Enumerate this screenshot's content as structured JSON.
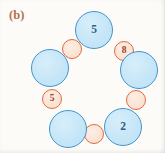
{
  "figure": {
    "panel_label": "(b)",
    "panel_label_color": "#b5714d",
    "background_color": "#fcfbf7",
    "width": 165,
    "height": 153
  },
  "palette": {
    "big_fill": "#c6e6f7",
    "big_stroke": "#3f95cf",
    "big_text": "#2f5d86",
    "small_fill": "#fbe3d4",
    "small_stroke": "#e06a42",
    "small_text": "#9e3c1d"
  },
  "chart_data": {
    "type": "diagram",
    "title": "(b)",
    "layout": "ring",
    "node_count": 10,
    "labeled_values": [
      5,
      8,
      2,
      5
    ],
    "nodes": [
      {
        "id": "big-top",
        "kind": "big",
        "label": "5",
        "cx": 94,
        "cy": 30,
        "r": 19,
        "angle_deg": 90
      },
      {
        "id": "small-upper-right",
        "kind": "small",
        "label": "8",
        "cx": 124,
        "cy": 51,
        "r": 10,
        "angle_deg": 54
      },
      {
        "id": "big-right",
        "kind": "big",
        "label": "",
        "cx": 139,
        "cy": 70,
        "r": 19,
        "angle_deg": 18
      },
      {
        "id": "small-lower-right",
        "kind": "small",
        "label": "",
        "cx": 136,
        "cy": 100,
        "r": 10,
        "angle_deg": -18
      },
      {
        "id": "big-bottom-right",
        "kind": "big",
        "label": "2",
        "cx": 123,
        "cy": 127,
        "r": 19,
        "angle_deg": -54
      },
      {
        "id": "small-bottom",
        "kind": "small",
        "label": "",
        "cx": 94,
        "cy": 134,
        "r": 10,
        "angle_deg": -90
      },
      {
        "id": "big-bottom-left",
        "kind": "big",
        "label": "",
        "cx": 68,
        "cy": 129,
        "r": 19,
        "angle_deg": -126
      },
      {
        "id": "small-lower-left",
        "kind": "small",
        "label": "5",
        "cx": 52,
        "cy": 99,
        "r": 10,
        "angle_deg": -162
      },
      {
        "id": "big-left",
        "kind": "big",
        "label": "",
        "cx": 50,
        "cy": 68,
        "r": 19,
        "angle_deg": 162
      },
      {
        "id": "small-upper-left",
        "kind": "small",
        "label": "",
        "cx": 72,
        "cy": 49,
        "r": 10,
        "angle_deg": 126
      }
    ]
  }
}
